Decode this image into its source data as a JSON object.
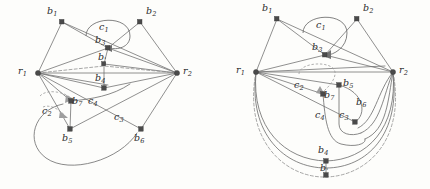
{
  "figure": {
    "type": "graph-diagram-pair",
    "background_color": "#fdfdfb",
    "ink_color": "#6b6b6b",
    "node_color": "#4a4a4a"
  },
  "panels": [
    {
      "id": "left",
      "name": "left-graph",
      "nodes": [
        {
          "id": "b1",
          "label": "b",
          "sub": "1",
          "x": 62,
          "y": 22,
          "lx": 47,
          "ly": 8
        },
        {
          "id": "b2",
          "label": "b",
          "sub": "2",
          "x": 140,
          "y": 22,
          "lx": 146,
          "ly": 8
        },
        {
          "id": "b3",
          "label": "b",
          "sub": "3",
          "x": 108,
          "y": 48,
          "lx": 97,
          "ly": 37
        },
        {
          "id": "bp",
          "label": "b",
          "sub": "'",
          "x": 104,
          "y": 64,
          "lx": 98,
          "ly": 55
        },
        {
          "id": "b4",
          "label": "b",
          "sub": "4",
          "x": 104,
          "y": 88,
          "lx": 97,
          "ly": 74
        },
        {
          "id": "b5",
          "label": "b",
          "sub": "5",
          "x": 70,
          "y": 129,
          "lx": 63,
          "ly": 133
        },
        {
          "id": "b6",
          "label": "b",
          "sub": "6",
          "x": 141,
          "y": 129,
          "lx": 135,
          "ly": 133
        },
        {
          "id": "b7",
          "label": "b",
          "sub": "7",
          "x": 71,
          "y": 101,
          "lx": 73,
          "ly": 99
        },
        {
          "id": "r1",
          "label": "r",
          "sub": "1",
          "x": 38,
          "y": 73,
          "lx": 18,
          "ly": 66
        },
        {
          "id": "r2",
          "label": "r",
          "sub": "2",
          "x": 177,
          "y": 73,
          "lx": 183,
          "ly": 66
        }
      ],
      "curve_labels": [
        {
          "id": "c1",
          "label": "c",
          "sub": "1",
          "lx": 99,
          "ly": 24
        },
        {
          "id": "c2",
          "label": "c",
          "sub": "2",
          "lx": 44,
          "ly": 109
        },
        {
          "id": "c3",
          "label": "c",
          "sub": "3",
          "lx": 116,
          "ly": 116
        },
        {
          "id": "c4",
          "label": "c",
          "sub": "4",
          "lx": 91,
          "ly": 101
        }
      ]
    },
    {
      "id": "right",
      "name": "right-graph",
      "nodes": [
        {
          "id": "b1",
          "label": "b",
          "sub": "1",
          "x": 62,
          "y": 19,
          "lx": 47,
          "ly": 6
        },
        {
          "id": "b2",
          "label": "b",
          "sub": "2",
          "x": 142,
          "y": 19,
          "lx": 148,
          "ly": 6
        },
        {
          "id": "b3",
          "label": "b",
          "sub": "3",
          "x": 110,
          "y": 55,
          "lx": 99,
          "ly": 43
        },
        {
          "id": "b5",
          "label": "b",
          "sub": "5",
          "x": 124,
          "y": 85,
          "lx": 128,
          "ly": 80
        },
        {
          "id": "b6",
          "label": "b",
          "sub": "6",
          "x": 140,
          "y": 104,
          "lx": 140,
          "ly": 99
        },
        {
          "id": "b7",
          "label": "b",
          "sub": "7",
          "x": 108,
          "y": 94,
          "lx": 110,
          "ly": 92
        },
        {
          "id": "c3n",
          "label": "b",
          "sub": "",
          "x": 140,
          "y": 122,
          "lx": 0,
          "ly": 0
        },
        {
          "id": "b4",
          "label": "b",
          "sub": "4",
          "x": 111,
          "y": 161,
          "lx": 104,
          "ly": 146
        },
        {
          "id": "bp",
          "label": "b",
          "sub": "'",
          "x": 111,
          "y": 175,
          "lx": 105,
          "ly": 165
        },
        {
          "id": "r1",
          "label": "r",
          "sub": "1",
          "x": 41,
          "y": 72,
          "lx": 21,
          "ly": 65
        },
        {
          "id": "r2",
          "label": "r",
          "sub": "2",
          "x": 178,
          "y": 72,
          "lx": 184,
          "ly": 65
        }
      ],
      "curve_labels": [
        {
          "id": "c1",
          "label": "c",
          "sub": "1",
          "lx": 101,
          "ly": 22
        },
        {
          "id": "c2",
          "label": "c",
          "sub": "2",
          "lx": 81,
          "ly": 82
        },
        {
          "id": "c3",
          "label": "c",
          "sub": "3",
          "lx": 125,
          "ly": 113
        },
        {
          "id": "c4",
          "label": "c",
          "sub": "4",
          "lx": 102,
          "ly": 112
        }
      ]
    }
  ]
}
